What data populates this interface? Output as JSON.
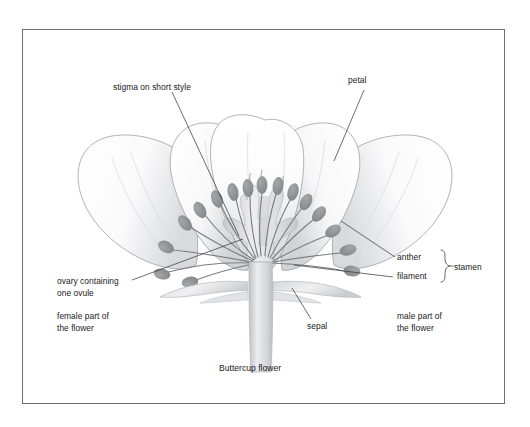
{
  "figure": {
    "caption": "Buttercup flower",
    "background_color": "#ffffff",
    "frame_color": "#6e6e74",
    "ink_color": "#1a1a1a"
  },
  "labels": {
    "stigma": "stigma on short style",
    "petal": "petal",
    "anther": "anther",
    "filament": "filament",
    "stamen": "stamen",
    "ovary": "ovary containing\none ovule",
    "female_part": "female part of\nthe flower",
    "male_part": "male part of\nthe flower",
    "sepal": "sepal"
  },
  "illustration": {
    "petal_fill": "#fbfbfc",
    "petal_outline": "#9a9aa0",
    "petal_shade": "#c9cacd",
    "anther_fill": "#8e9094",
    "filament_stroke": "#7b7d82",
    "receptacle_fill": "#e3e4e6",
    "stem_fill": "#dcdde0",
    "sepal_fill": "#d6d7da",
    "leader_color": "#3c3c40"
  }
}
